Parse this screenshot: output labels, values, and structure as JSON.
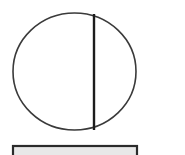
{
  "canvas": {
    "width": 185,
    "height": 155,
    "background_color": "#ffffff",
    "title": "line-drawing-circle-with-chord-and-bar"
  },
  "figure": {
    "stroke_color": "#3a3a3a",
    "chord_color": "#1c1c1c",
    "bar_color": "#2b2b2b",
    "bar_fill": "#e8e8e8",
    "shapes": [
      {
        "name": "circle-outline",
        "type": "ellipse",
        "cx": 74.5,
        "cy": 71.5,
        "rx": 61.5,
        "ry": 58.5,
        "stroke_width": 1.6,
        "fill": "none"
      },
      {
        "name": "vertical-chord-line",
        "type": "line",
        "x1": 94,
        "y1": 14,
        "x2": 94,
        "y2": 130,
        "stroke_width": 2.4
      },
      {
        "name": "bottom-bar-rectangle",
        "type": "rect",
        "x": 13,
        "y": 146,
        "width": 124,
        "height": 14,
        "stroke_width": 2.2
      }
    ]
  }
}
